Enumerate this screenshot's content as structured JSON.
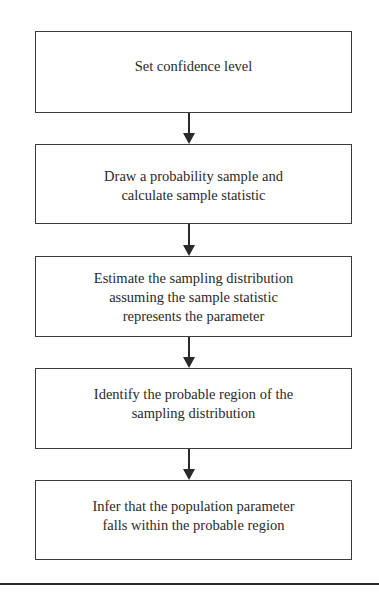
{
  "flowchart": {
    "steps": [
      {
        "label": "Set confidence level"
      },
      {
        "label": "Draw a probability sample and\ncalculate sample statistic"
      },
      {
        "label": "Estimate the sampling distribution\nassuming the sample statistic\nrepresents the parameter"
      },
      {
        "label": "Identify the probable region of the\nsampling distribution"
      },
      {
        "label": "Infer that the population parameter\nfalls within the probable region"
      }
    ],
    "connectors": [
      {
        "from": 0,
        "to": 1,
        "type": "arrow-down"
      },
      {
        "from": 1,
        "to": 2,
        "type": "arrow-down"
      },
      {
        "from": 2,
        "to": 3,
        "type": "arrow-down"
      },
      {
        "from": 3,
        "to": 4,
        "type": "arrow-down"
      }
    ],
    "colors": {
      "stroke": "#3a3a3a",
      "text": "#2a2a2a",
      "background": "#ffffff"
    }
  }
}
